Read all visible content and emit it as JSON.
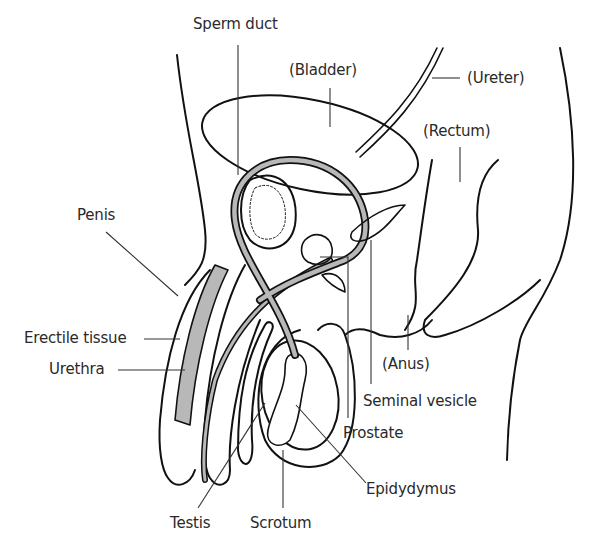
{
  "diagram": {
    "labels": {
      "sperm_duct": "Sperm duct",
      "bladder": "(Bladder)",
      "ureter": "(Ureter)",
      "rectum": "(Rectum)",
      "penis": "Penis",
      "erectile_tissue": "Erectile tissue",
      "urethra": "Urethra",
      "anus": "(Anus)",
      "seminal_vesicle": "Seminal vesicle",
      "prostate": "Prostate",
      "epidydymus": "Epidydymus",
      "testis": "Testis",
      "scrotum": "Scrotum"
    },
    "colors": {
      "outline": "#111111",
      "shading": "#b8b8b8",
      "leader_line": "#333333",
      "text": "#2a2a2a"
    }
  }
}
